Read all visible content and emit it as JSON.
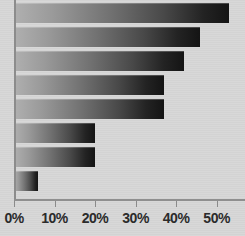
{
  "chart_data": {
    "type": "bar",
    "orientation": "horizontal",
    "title": "",
    "xlabel": "",
    "ylabel": "",
    "xlim": [
      0,
      57
    ],
    "grid": false,
    "legend": null,
    "categories": [
      "s",
      "s",
      "s",
      "y",
      "s",
      "s",
      "e",
      "er"
    ],
    "values": [
      53,
      46,
      42,
      37,
      37,
      20,
      20,
      6
    ],
    "value_suffix": "%",
    "xticks": [
      0,
      10,
      20,
      30,
      40,
      50
    ],
    "xticklabels": [
      "0%",
      "10%",
      "20%",
      "30%",
      "40%",
      "50%"
    ]
  },
  "axis": {
    "tick_labels": [
      "0%",
      "10%",
      "20%",
      "30%",
      "40%",
      "50%"
    ]
  },
  "category_labels": {
    "row0": "s",
    "row1": "s",
    "row2": "s",
    "row3": "y",
    "row4": "s",
    "row5": "s",
    "row6": "e",
    "row7": "er"
  },
  "colors": {
    "background": "#d7d7d7",
    "bar_gradient_start": "#b0b0b0",
    "bar_gradient_end": "#141414",
    "axis_line": "#8c8c8c",
    "tick_text": "#2b2b2b"
  }
}
